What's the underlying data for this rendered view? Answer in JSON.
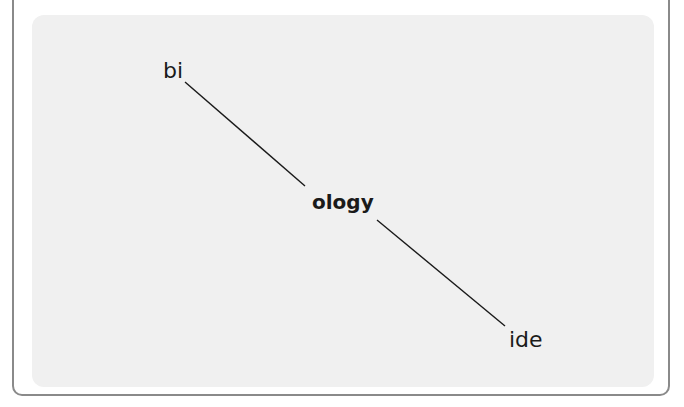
{
  "header": {
    "clipped_text": "Morphology: word parts"
  },
  "diagram": {
    "type": "word-morphology-tree",
    "nodes": [
      {
        "id": "prefix",
        "label": "bi",
        "role": "prefix"
      },
      {
        "id": "root",
        "label": "ology",
        "role": "root"
      },
      {
        "id": "suffix",
        "label": "ide",
        "role": "suffix"
      }
    ],
    "edges": [
      {
        "from": "prefix",
        "to": "root"
      },
      {
        "from": "root",
        "to": "suffix"
      }
    ]
  },
  "colors": {
    "panel_background": "#f0f0f0",
    "border": "#8a8a8a",
    "text": "#1a1a1a",
    "line": "#1a1a1a"
  }
}
